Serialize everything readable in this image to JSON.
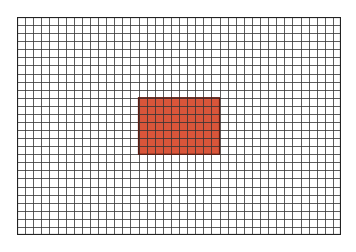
{
  "grid": {
    "columns": 40,
    "rows": 27,
    "line_color": "#333333",
    "border_color": "#222222",
    "background": "#ffffff"
  },
  "highlight": {
    "col_start": 15,
    "row_start": 10,
    "col_span": 10,
    "row_span": 7,
    "fill": "#d9553a",
    "stroke": "#5a1a10"
  }
}
